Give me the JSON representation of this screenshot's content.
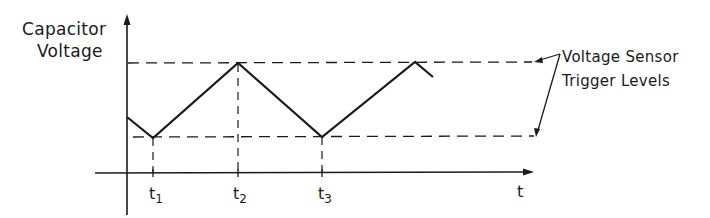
{
  "diagram": {
    "y_axis_label_line1": "Capacitor",
    "y_axis_label_line2": "Voltage",
    "x_axis_label": "t",
    "annotation_line1": "Voltage Sensor",
    "annotation_line2": "Trigger Levels",
    "time_markers": [
      {
        "base": "t",
        "sub": "1"
      },
      {
        "base": "t",
        "sub": "2"
      },
      {
        "base": "t",
        "sub": "3"
      }
    ],
    "trigger_levels": [
      "upper",
      "lower"
    ],
    "waveform": "triangular sawtooth oscillating between lower and upper trigger levels",
    "line_color": "#1a1a1a"
  }
}
